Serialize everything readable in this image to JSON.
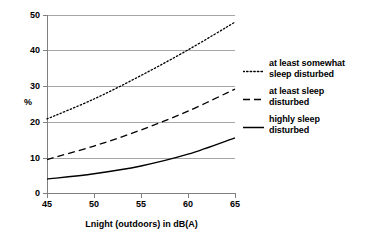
{
  "chart_data": {
    "type": "line",
    "title": "",
    "xlabel": "Lnight (outdoors) in dB(A)",
    "ylabel": "%",
    "xlim": [
      45,
      65
    ],
    "ylim": [
      0,
      50
    ],
    "xticks": [
      45,
      50,
      55,
      60,
      65
    ],
    "yticks": [
      0,
      10,
      20,
      30,
      40,
      50
    ],
    "grid": true,
    "grid_axis": "y",
    "legend_position": "right",
    "x": [
      45,
      50,
      55,
      60,
      65
    ],
    "series": [
      {
        "name": "at least somewhat sleep disturbed",
        "style": "dotted",
        "color": "#000000",
        "values": [
          20.8,
          26.4,
          33.0,
          40.2,
          48.0
        ]
      },
      {
        "name": "at least sleep disturbed",
        "style": "dashed",
        "color": "#000000",
        "values": [
          9.4,
          13.2,
          17.7,
          23.0,
          29.2
        ]
      },
      {
        "name": "highly sleep disturbed",
        "style": "solid",
        "color": "#000000",
        "values": [
          3.9,
          5.4,
          7.6,
          10.9,
          15.5
        ]
      }
    ]
  },
  "axes": {
    "y_tick_labels": [
      "50",
      "40",
      "30",
      "20",
      "10",
      "0"
    ],
    "x_tick_labels": [
      "45",
      "50",
      "55",
      "60",
      "65"
    ],
    "y_axis_title": "%",
    "x_axis_title": "Lnight (outdoors) in dB(A)"
  },
  "legend": {
    "entries": [
      {
        "line1": "at least somewhat",
        "line2": "sleep disturbed",
        "sample": "dotted-line-sample"
      },
      {
        "line1": "at least sleep",
        "line2": "disturbed",
        "sample": "dashed-line-sample"
      },
      {
        "line1": "highly sleep",
        "line2": "disturbed",
        "sample": "solid-line-sample"
      }
    ]
  }
}
